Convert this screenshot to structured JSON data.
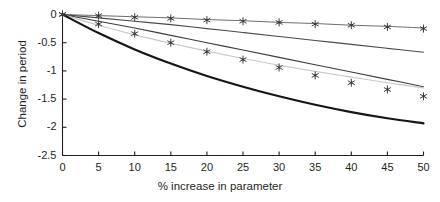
{
  "chart_data": {
    "type": "line",
    "title": "",
    "xlabel": "% increase in parameter",
    "ylabel": "Change in period",
    "xlim": [
      0,
      50
    ],
    "ylim": [
      -2.5,
      0
    ],
    "xticks": [
      "0",
      "5",
      "10",
      "15",
      "20",
      "25",
      "30",
      "35",
      "40",
      "45",
      "50"
    ],
    "xtick_values": [
      0,
      5,
      10,
      15,
      20,
      25,
      30,
      35,
      40,
      45,
      50
    ],
    "yticks": [
      "0",
      "-0.5",
      "-1",
      "-1.5",
      "-2",
      "-2.5"
    ],
    "ytick_values": [
      0,
      -0.5,
      -1,
      -1.5,
      -2,
      -2.5
    ],
    "grid": false,
    "legend": "none",
    "x": [
      0,
      5,
      10,
      15,
      20,
      25,
      30,
      35,
      40,
      45,
      50
    ],
    "series": [
      {
        "name": "flat-line",
        "style": "line",
        "color": "#6e6e6e",
        "width": 1.0,
        "values": [
          0.0,
          -0.02,
          -0.04,
          -0.06,
          -0.09,
          -0.11,
          -0.14,
          -0.16,
          -0.19,
          -0.21,
          -0.24
        ]
      },
      {
        "name": "upper-mid-line",
        "style": "line",
        "color": "#4a4a4a",
        "width": 1.1,
        "values": [
          0.0,
          -0.06,
          -0.12,
          -0.18,
          -0.25,
          -0.32,
          -0.39,
          -0.46,
          -0.53,
          -0.6,
          -0.67
        ]
      },
      {
        "name": "lower-mid-line",
        "style": "line",
        "color": "#3c3c3c",
        "width": 1.1,
        "values": [
          0.0,
          -0.12,
          -0.24,
          -0.37,
          -0.5,
          -0.63,
          -0.76,
          -0.89,
          -1.02,
          -1.15,
          -1.28
        ]
      },
      {
        "name": "light-gray-curve",
        "style": "line",
        "color": "#c8c8c8",
        "width": 1.2,
        "values": [
          0.0,
          -0.19,
          -0.36,
          -0.51,
          -0.65,
          -0.78,
          -0.9,
          -1.01,
          -1.11,
          -1.21,
          -1.3
        ]
      },
      {
        "name": "thick-black-curve",
        "style": "line",
        "color": "#151515",
        "width": 2.2,
        "values": [
          0.0,
          -0.33,
          -0.62,
          -0.87,
          -1.09,
          -1.28,
          -1.45,
          -1.6,
          -1.73,
          -1.84,
          -1.93
        ]
      },
      {
        "name": "upper-star-markers",
        "style": "markers",
        "marker": "asterisk",
        "color": "#3a3a3a",
        "values": [
          0.0,
          -0.02,
          -0.05,
          -0.07,
          -0.1,
          -0.12,
          -0.14,
          -0.17,
          -0.19,
          -0.22,
          -0.25
        ]
      },
      {
        "name": "lower-star-markers",
        "style": "markers",
        "marker": "asterisk",
        "color": "#3a3a3a",
        "values": [
          0.0,
          -0.17,
          -0.34,
          -0.5,
          -0.66,
          -0.8,
          -0.94,
          -1.08,
          -1.21,
          -1.33,
          -1.45
        ]
      }
    ]
  },
  "axes": {
    "axis_color": "#231f20",
    "tick_length": 4
  }
}
